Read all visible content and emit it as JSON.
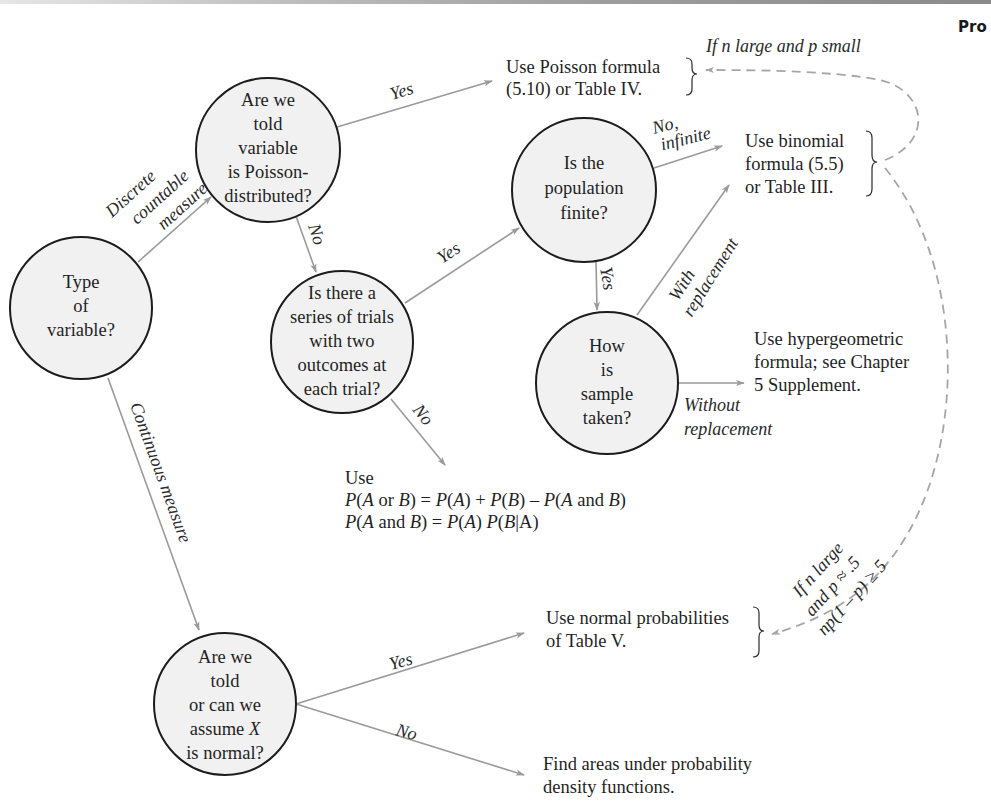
{
  "header": {
    "page_header_fragment": "Pro"
  },
  "colors": {
    "node_fill": "#f1f1f1",
    "node_stroke": "#1c1c1c",
    "edge": "#9a9a9a",
    "dashed_edge": "#a6a6a6",
    "text": "#1f1f1f"
  },
  "nodes": {
    "type_of_variable": {
      "lines": [
        "Type",
        "of",
        "variable?"
      ]
    },
    "told_poisson": {
      "lines": [
        "Are we",
        "told",
        "variable",
        "is Poisson-",
        "distributed?"
      ]
    },
    "series_of_trials": {
      "lines": [
        "Is there a",
        "series of trials",
        "with two",
        "outcomes at",
        "each trial?"
      ]
    },
    "population_finite": {
      "lines": [
        "Is the",
        "population",
        "finite?"
      ]
    },
    "how_sample_taken": {
      "lines": [
        "How",
        "is",
        "sample",
        "taken?"
      ]
    },
    "assume_normal": {
      "line1": "Are we",
      "line2": "told",
      "line3": "or can we",
      "line4_prefix": "assume ",
      "line4_var": "X",
      "line5": "is normal?"
    }
  },
  "outcomes": {
    "poisson": {
      "lines": [
        "Use Poisson formula",
        "(5.10) or Table IV."
      ]
    },
    "binomial": {
      "lines": [
        "Use binomial",
        "formula (5.5)",
        "or Table III."
      ]
    },
    "hypergeometric": {
      "lines": [
        "Use hypergeometric",
        "formula; see Chapter",
        "5 Supplement."
      ]
    },
    "general_rules": {
      "line1": "Use",
      "line2": {
        "p1": "P",
        "p2": "(",
        "a1": "A",
        "t1": " or ",
        "b1": "B",
        "t2": ") = ",
        "p3": "P",
        "t3": "(",
        "a2": "A",
        "t4": ") + ",
        "p4": "P",
        "t5": "(",
        "b2": "B",
        "t6": ") – ",
        "p5": "P",
        "t7": "(",
        "a3": "A",
        "t8": " and ",
        "b3": "B",
        "t9": ")"
      },
      "line3": {
        "p1": "P",
        "t1": "(",
        "a1": "A",
        "t2": " and ",
        "b1": "B",
        "t3": ") = ",
        "p2": "P",
        "t4": "(",
        "a2": "A",
        "t5": ") ",
        "p3": "P",
        "t6": "(",
        "b2": "B",
        "t7": "|A)"
      }
    },
    "normal_table": {
      "lines": [
        "Use normal probabilities",
        "of Table V."
      ]
    },
    "density_areas": {
      "lines": [
        "Find areas under probability",
        "density functions."
      ]
    }
  },
  "edge_labels": {
    "discrete": [
      "Discrete",
      "countable",
      "measure"
    ],
    "continuous": "Continuous measure",
    "poisson_yes": "Yes",
    "poisson_no": "No",
    "trials_yes": "Yes",
    "trials_no": "No",
    "finite_no": [
      "No,",
      "infinite"
    ],
    "finite_yes": "Yes",
    "with_replacement": [
      "With",
      "replacement"
    ],
    "without_replacement": [
      "Without",
      "replacement"
    ],
    "normal_yes": "Yes",
    "normal_no": "No",
    "approx_poisson": "If n large and p small",
    "approx_normal": [
      "If n large",
      "and p ≈ .5",
      "np(1 – p) ≥ 5"
    ]
  }
}
